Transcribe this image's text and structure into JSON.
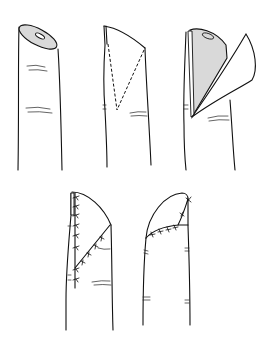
{
  "figure": {
    "background": "#ffffff",
    "ink_color": "#111111",
    "tissue_fill": "#d9d9d9",
    "panels": [
      {
        "id": "step-1",
        "label": "oblique fingertip amputation with exposed pulp and bone"
      },
      {
        "id": "step-2",
        "label": "triangular flap outline marked with dashed incision lines"
      },
      {
        "id": "step-3",
        "label": "flap raised, exposing textured subcutaneous tissue"
      },
      {
        "id": "step-4",
        "label": "flap advanced and sutured, dorsal-lateral view"
      },
      {
        "id": "step-5",
        "label": "flap sutured over tip, lateral view"
      }
    ]
  }
}
